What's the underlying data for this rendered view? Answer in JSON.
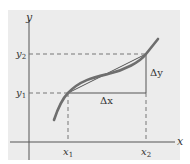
{
  "diagram": {
    "type": "secant-line-increments",
    "axes": {
      "x_label": "x",
      "y_label": "y"
    },
    "points": {
      "x1_label": "x",
      "x1_sub": "1",
      "x2_label": "x",
      "x2_sub": "2",
      "y1_label": "y",
      "y1_sub": "1",
      "y2_label": "y",
      "y2_sub": "2"
    },
    "increments": {
      "dx_label": "Δx",
      "dy_label": "Δy"
    },
    "colors": {
      "panel_bg": "#ececec",
      "axis": "#555555",
      "curve": "#6e6e6e",
      "secant": "#555555",
      "dashed": "#777777",
      "text": "#333333"
    }
  }
}
